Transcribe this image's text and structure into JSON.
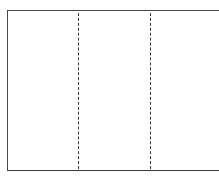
{
  "diagram": {
    "type": "trifold-layout",
    "panels": 3,
    "fold_lines": [
      {
        "x": 78,
        "style": "dashed"
      },
      {
        "x": 150,
        "style": "dashed"
      }
    ],
    "colors": {
      "border": "#4a4a4a",
      "fold_line": "#3a3a3a",
      "background": "#ffffff"
    }
  }
}
